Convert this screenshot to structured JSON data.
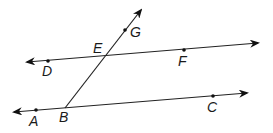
{
  "diagram": {
    "colors": {
      "line": "#222222",
      "point": "#111111",
      "label": "#1a1a1a",
      "background": "#ffffff"
    },
    "lines": [
      {
        "id": "line-DF",
        "x1": 27,
        "y1": 62,
        "x2": 258,
        "y2": 43,
        "arrows": "both"
      },
      {
        "id": "line-AC",
        "x1": 14,
        "y1": 112,
        "x2": 247,
        "y2": 93,
        "arrows": "both"
      },
      {
        "id": "ray-BG",
        "x1": 65,
        "y1": 108,
        "x2": 141,
        "y2": 10,
        "arrows": "end"
      }
    ],
    "points": [
      {
        "name": "D",
        "x": 48,
        "y": 61,
        "lx": 42,
        "ly": 76
      },
      {
        "name": "E",
        "x": 105,
        "y": 56,
        "lx": 93,
        "ly": 53
      },
      {
        "name": "F",
        "x": 184,
        "y": 50,
        "lx": 178,
        "ly": 66
      },
      {
        "name": "G",
        "x": 125,
        "y": 30,
        "lx": 130,
        "ly": 37
      },
      {
        "name": "A",
        "x": 36,
        "y": 110,
        "lx": 29,
        "ly": 126
      },
      {
        "name": "B",
        "x": 65,
        "y": 108,
        "lx": 59,
        "ly": 122
      },
      {
        "name": "C",
        "x": 213,
        "y": 96,
        "lx": 207,
        "ly": 112
      }
    ],
    "labels": {
      "D": "D",
      "E": "E",
      "F": "F",
      "G": "G",
      "A": "A",
      "B": "B",
      "C": "C"
    }
  }
}
